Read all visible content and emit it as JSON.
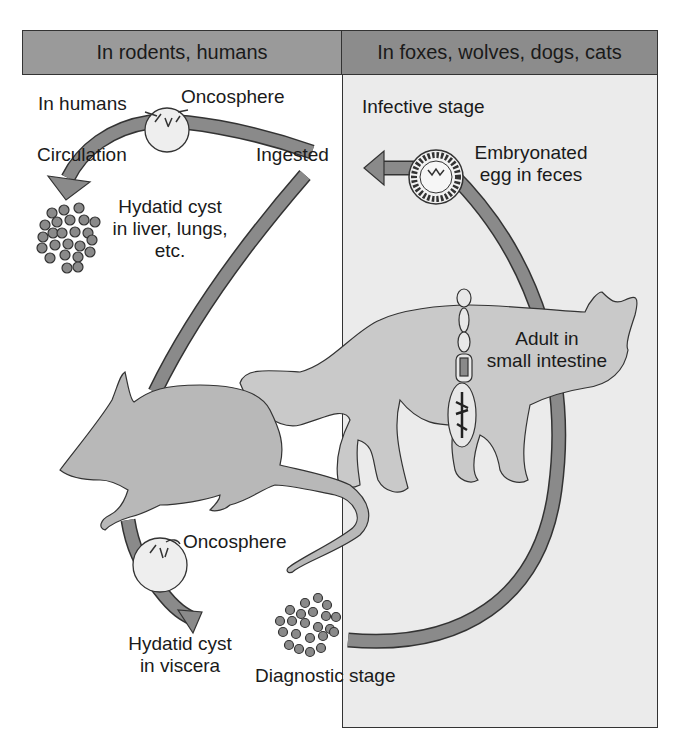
{
  "diagram": {
    "type": "life-cycle"
  },
  "header": {
    "left_label": "In rodents, humans",
    "right_label": "In foxes, wolves, dogs, cats"
  },
  "labels": {
    "in_humans": "In humans",
    "oncosphere_top": "Oncosphere",
    "circulation": "Circulation",
    "ingested": "Ingested",
    "hydatid_liver_line1": "Hydatid cyst",
    "hydatid_liver_line2": "in liver, lungs,",
    "hydatid_liver_line3": "etc.",
    "infective_stage": "Infective stage",
    "embryonated_line1": "Embryonated",
    "embryonated_line2": "egg in feces",
    "adult_line1": "Adult in",
    "adult_line2": "small intestine",
    "oncosphere_bottom": "Oncosphere",
    "hydatid_viscera_line1": "Hydatid cyst",
    "hydatid_viscera_line2": "in viscera",
    "diagnostic_stage": "Diagnostic stage"
  },
  "colors": {
    "header_left": "#9a9a9a",
    "header_right": "#8c8c8c",
    "right_panel": "#ebebeb",
    "arrow": "#8a8a8a",
    "animal": "#b8b8b8",
    "cat": "#c9c9c9",
    "outline": "#333333"
  }
}
